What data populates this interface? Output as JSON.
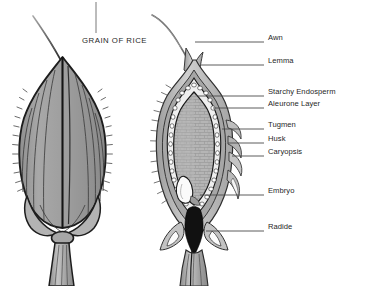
{
  "figure": {
    "title": "GRAIN OF RICE",
    "ink_color": "#2b2b2b",
    "grain_fill": "#9a9a9a",
    "endosperm_fill": "#b9b9b9",
    "husk_fill": "#c9c9c9",
    "embryo_fill": "#f4f4f4",
    "radicle_fill": "#141414",
    "background": "#ffffff"
  },
  "panels": {
    "whole_grain": {
      "name": "whole rice grain exterior view"
    },
    "cross_section": {
      "name": "longitudinal section of rice grain"
    }
  },
  "labels": [
    {
      "id": "awn",
      "text": "Awn",
      "text_x": 268,
      "text_y": 39,
      "line_x1": 195,
      "line_y1": 42,
      "line_x2": 264,
      "line_y2": 42
    },
    {
      "id": "lemma",
      "text": "Lemma",
      "text_x": 268,
      "text_y": 62,
      "line_x1": 200,
      "line_y1": 65,
      "line_x2": 264,
      "line_y2": 65
    },
    {
      "id": "starchy-endosperm",
      "text": "Starchy Endosperm",
      "text_x": 268,
      "text_y": 93,
      "line_x1": 198,
      "line_y1": 96,
      "line_x2": 264,
      "line_y2": 96
    },
    {
      "id": "aleurone-layer",
      "text": "Aleurone Layer",
      "text_x": 268,
      "text_y": 105,
      "line_x1": 213,
      "line_y1": 108,
      "line_x2": 264,
      "line_y2": 108
    },
    {
      "id": "tugmen",
      "text": "Tugmen",
      "text_x": 268,
      "text_y": 126,
      "line_x1": 222,
      "line_y1": 129,
      "line_x2": 264,
      "line_y2": 129
    },
    {
      "id": "husk",
      "text": "Husk",
      "text_x": 268,
      "text_y": 140,
      "line_x1": 228,
      "line_y1": 143,
      "line_x2": 264,
      "line_y2": 143
    },
    {
      "id": "caryopsis",
      "text": "Caryopsis",
      "text_x": 268,
      "text_y": 153,
      "line_x1": 232,
      "line_y1": 156,
      "line_x2": 264,
      "line_y2": 156
    },
    {
      "id": "embryo",
      "text": "Embryo",
      "text_x": 268,
      "text_y": 192,
      "line_x1": 200,
      "line_y1": 195,
      "line_x2": 264,
      "line_y2": 195
    },
    {
      "id": "radide",
      "text": "Radide",
      "text_x": 268,
      "text_y": 228,
      "line_x1": 206,
      "line_y1": 231,
      "line_x2": 264,
      "line_y2": 231
    }
  ],
  "title_leader": {
    "x": 96,
    "y1": 2,
    "y2": 33
  }
}
